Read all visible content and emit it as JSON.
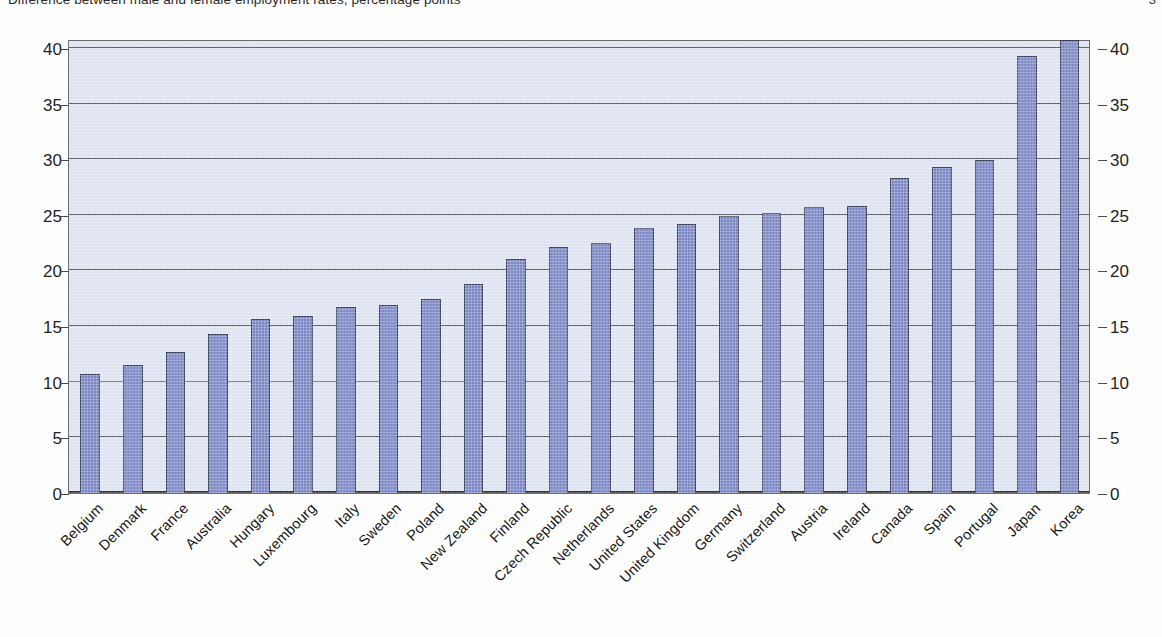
{
  "title": {
    "text": "Difference between male and female employment rates, percentage points",
    "page_number": "3"
  },
  "axes": {
    "y_ticks": [
      "0",
      "5",
      "10",
      "15",
      "20",
      "25",
      "30",
      "35",
      "40"
    ],
    "y_min": 0,
    "y_max": 40.8
  },
  "chart_data": {
    "type": "bar",
    "title": "Difference between male and female employment rates, percentage points",
    "xlabel": "",
    "ylabel": "",
    "ylim": [
      0,
      40.8
    ],
    "grid": true,
    "legend": "none",
    "dual_y_axis": true,
    "bar_color": "#7b88c4",
    "panel_color": "#dde3f0",
    "categories": [
      "Belgium",
      "Denmark",
      "France",
      "Australia",
      "Hungary",
      "Luxembourg",
      "Italy",
      "Sweden",
      "Poland",
      "New Zealand",
      "Finland",
      "Czech Republic",
      "Netherlands",
      "United States",
      "United Kingdom",
      "Germany",
      "Switzerland",
      "Austria",
      "Ireland",
      "Canada",
      "Spain",
      "Portugal",
      "Japan",
      "Korea"
    ],
    "values": [
      10.7,
      11.5,
      12.7,
      14.3,
      15.6,
      15.9,
      16.7,
      16.9,
      17.4,
      18.8,
      21.0,
      22.1,
      22.5,
      23.8,
      24.2,
      24.9,
      25.2,
      25.7,
      25.8,
      28.3,
      29.3,
      29.9,
      39.3,
      40.7
    ]
  }
}
